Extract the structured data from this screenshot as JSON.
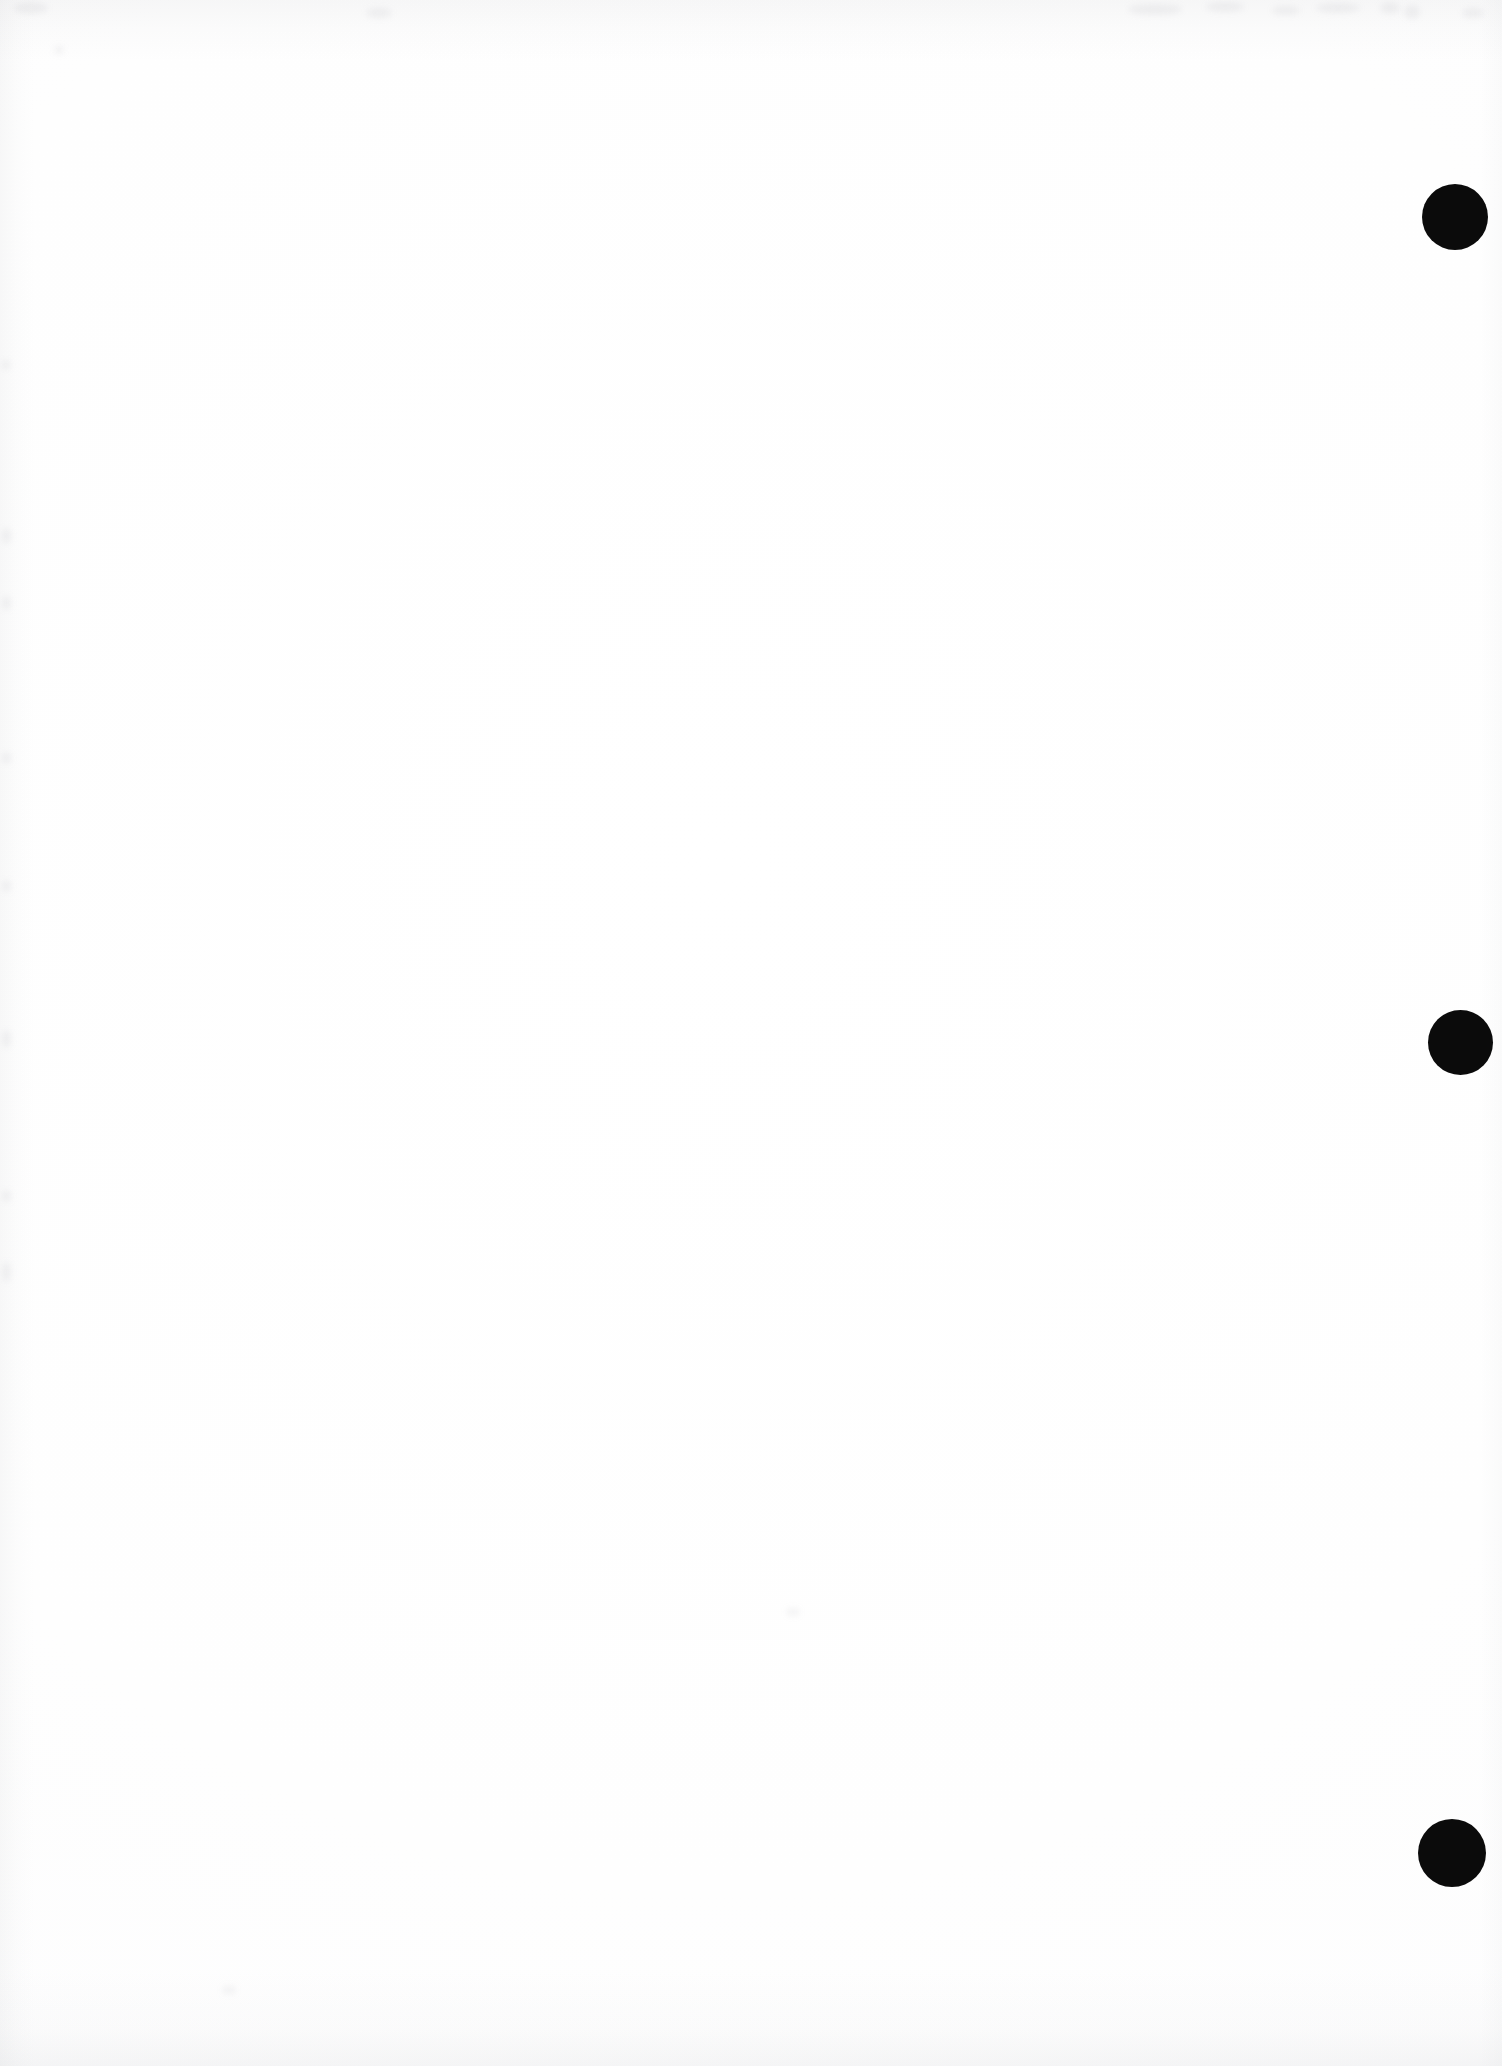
{
  "page": {
    "width": 1502,
    "height": 2066,
    "background_color": "#fdfdfe",
    "content_text": ""
  },
  "marks": {
    "ink_color": "#0b0b0b",
    "dots": [
      {
        "id": "margin-dot-1",
        "cx": 1455,
        "cy": 217,
        "diameter": 66
      },
      {
        "id": "margin-dot-2",
        "cx": 1460,
        "cy": 1042,
        "diameter": 65
      },
      {
        "id": "margin-dot-3",
        "cx": 1452,
        "cy": 1853,
        "diameter": 68
      }
    ]
  },
  "artifacts": {
    "shade_color": "#92959c",
    "smudges": [
      {
        "x": 1128,
        "y": 4,
        "w": 54,
        "h": 11
      },
      {
        "x": 1206,
        "y": 2,
        "w": 38,
        "h": 10
      },
      {
        "x": 1272,
        "y": 6,
        "w": 28,
        "h": 9
      },
      {
        "x": 1316,
        "y": 3,
        "w": 44,
        "h": 10
      },
      {
        "x": 1380,
        "y": 2,
        "w": 20,
        "h": 12
      },
      {
        "x": 1404,
        "y": 5,
        "w": 16,
        "h": 14
      },
      {
        "x": 1462,
        "y": 8,
        "w": 22,
        "h": 10
      },
      {
        "x": 366,
        "y": 8,
        "w": 26,
        "h": 10
      },
      {
        "x": 14,
        "y": 2,
        "w": 34,
        "h": 12
      },
      {
        "x": 54,
        "y": 46,
        "w": 10,
        "h": 8
      },
      {
        "x": 2,
        "y": 360,
        "w": 8,
        "h": 10
      },
      {
        "x": 2,
        "y": 528,
        "w": 9,
        "h": 16
      },
      {
        "x": 2,
        "y": 596,
        "w": 9,
        "h": 14
      },
      {
        "x": 2,
        "y": 752,
        "w": 9,
        "h": 12
      },
      {
        "x": 2,
        "y": 880,
        "w": 9,
        "h": 12
      },
      {
        "x": 2,
        "y": 1030,
        "w": 9,
        "h": 18
      },
      {
        "x": 2,
        "y": 1190,
        "w": 9,
        "h": 12
      },
      {
        "x": 2,
        "y": 1262,
        "w": 9,
        "h": 20
      },
      {
        "x": 222,
        "y": 1986,
        "w": 14,
        "h": 8
      },
      {
        "x": 786,
        "y": 1608,
        "w": 14,
        "h": 8
      }
    ]
  },
  "caption": {
    "alt_text": "Blank page with three black registration dots in the right margin"
  }
}
